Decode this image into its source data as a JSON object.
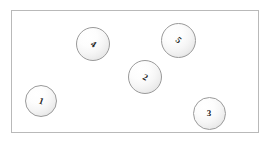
{
  "diagram": {
    "canvas": {
      "width": 273,
      "height": 145,
      "background_color": "#ffffff"
    },
    "container": {
      "name": "bounding-rectangle",
      "x": 11,
      "y": 10,
      "width": 248,
      "height": 123,
      "border_color": "#b9b9b9",
      "fill_color": "#ffffff"
    },
    "sphere_style": {
      "border_color": "#9a9a9a",
      "highlight_color": "#ffffff",
      "shade_color": "#d6d6d6",
      "label_color": "#1b1b1b"
    },
    "spheres": [
      {
        "label": "1",
        "cx": 41,
        "cy": 101,
        "diameter": 32,
        "rotation_deg": 20
      },
      {
        "label": "4",
        "cx": 93,
        "cy": 44,
        "diameter": 34,
        "rotation_deg": 35
      },
      {
        "label": "2",
        "cx": 145,
        "cy": 77,
        "diameter": 34,
        "rotation_deg": 28
      },
      {
        "label": "5",
        "cx": 178,
        "cy": 40,
        "diameter": 35,
        "rotation_deg": 42
      },
      {
        "label": "3",
        "cx": 209,
        "cy": 113,
        "diameter": 33,
        "rotation_deg": 0
      }
    ]
  }
}
